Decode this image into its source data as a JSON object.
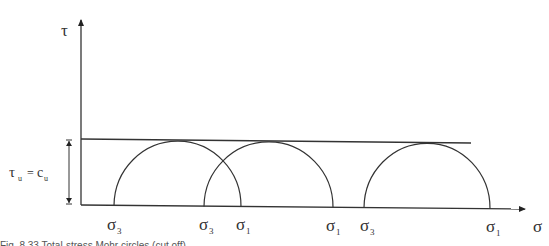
{
  "diagram": {
    "axes": {
      "y_label": "τ",
      "x_label": "σ"
    },
    "envelope_label": {
      "tau": "τ",
      "tau_sub": "u",
      "equals": "=",
      "c": "c",
      "c_sub": "u"
    },
    "circles": [
      {
        "sigma3": {
          "base": "σ",
          "sub": "3"
        },
        "sigma1": {
          "base": "σ",
          "sub": "1"
        }
      },
      {
        "sigma3": {
          "base": "σ",
          "sub": "3"
        },
        "sigma1": {
          "base": "σ",
          "sub": "1"
        }
      },
      {
        "sigma3": {
          "base": "σ",
          "sub": "3"
        },
        "sigma1": {
          "base": "σ",
          "sub": "1"
        }
      }
    ],
    "caption_partial": "Fig. 8.33  Total-stress Mohr circles (cut off)"
  },
  "colors": {
    "line": "#333333",
    "background": "#ffffff"
  }
}
